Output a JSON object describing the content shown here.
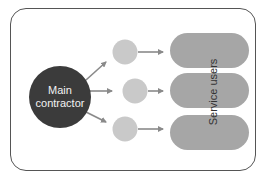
{
  "diagram": {
    "main_node": {
      "label_line1": "Main",
      "label_line2": "contractor",
      "color": "#3b3b3b"
    },
    "intermediate_nodes": [
      {
        "cx": 125,
        "cy": 52,
        "r": 12
      },
      {
        "cx": 135,
        "cy": 90,
        "r": 12
      },
      {
        "cx": 125,
        "cy": 128,
        "r": 12
      }
    ],
    "intermediate_color": "#c9c9c9",
    "target_group": {
      "label": "Service users",
      "color": "#a6a6a6",
      "pills": [
        {
          "x": 170,
          "y": 33,
          "w": 79,
          "h": 35
        },
        {
          "x": 170,
          "y": 73,
          "w": 79,
          "h": 35
        },
        {
          "x": 170,
          "y": 115,
          "w": 79,
          "h": 35
        }
      ]
    },
    "arrow_color": "#8a8a8a"
  }
}
